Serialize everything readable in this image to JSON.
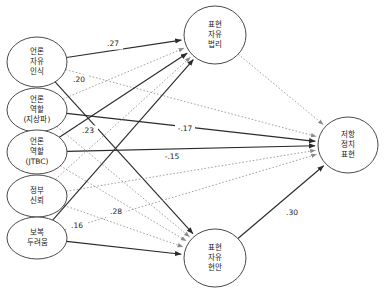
{
  "diagram": {
    "type": "path-diagram",
    "nodes": {
      "exogenous": [
        {
          "id": "press_freedom_perception",
          "label_lines": [
            "언론",
            "자유",
            "인식"
          ],
          "cx": 37,
          "cy": 62,
          "rx": 30,
          "ry": 25
        },
        {
          "id": "press_role_terrestrial",
          "label_lines": [
            "언론",
            "역할",
            "(지상파)"
          ],
          "cx": 37,
          "cy": 110,
          "rx": 30,
          "ry": 22
        },
        {
          "id": "press_role_jtbc",
          "label_lines": [
            "언론",
            "역할",
            "(JTBC)"
          ],
          "cx": 37,
          "cy": 152,
          "rx": 30,
          "ry": 22
        },
        {
          "id": "government_trust",
          "label_lines": [
            "정부",
            "신뢰"
          ],
          "cx": 37,
          "cy": 196,
          "rx": 30,
          "ry": 21
        },
        {
          "id": "fear_of_retaliation",
          "label_lines": [
            "보복",
            "두려움"
          ],
          "cx": 37,
          "cy": 238,
          "rx": 30,
          "ry": 21
        }
      ],
      "mediators": [
        {
          "id": "expression_freedom_jurisprudence",
          "label_lines": [
            "표현",
            "자유",
            "법리"
          ],
          "cx": 215,
          "cy": 35,
          "rx": 31,
          "ry": 29
        },
        {
          "id": "expression_freedom_issues",
          "label_lines": [
            "표현",
            "자유",
            "현안"
          ],
          "cx": 215,
          "cy": 258,
          "rx": 31,
          "ry": 29
        }
      ],
      "outcome": [
        {
          "id": "resistance_political_expression",
          "label_lines": [
            "저항",
            "정치",
            "표현"
          ],
          "cx": 348,
          "cy": 145,
          "rx": 30,
          "ry": 28
        }
      ]
    },
    "edges": [
      {
        "id": "e1",
        "from": "press_freedom_perception",
        "to": "expression_freedom_jurisprudence",
        "style": "solid",
        "coefficient": ".27",
        "label_x": 113,
        "label_y": 44
      },
      {
        "id": "e2",
        "from": "press_freedom_perception",
        "to": "expression_freedom_issues",
        "style": "solid",
        "coefficient": ".20",
        "label_x": 79,
        "label_y": 80
      },
      {
        "id": "e3",
        "from": "press_freedom_perception",
        "to": "resistance_political_expression",
        "style": "dotted",
        "coefficient": "",
        "label_x": 0,
        "label_y": 0
      },
      {
        "id": "e4",
        "from": "press_role_terrestrial",
        "to": "resistance_political_expression",
        "style": "solid",
        "coefficient": "-.17",
        "label_x": 185,
        "label_y": 129
      },
      {
        "id": "e5",
        "from": "press_role_terrestrial",
        "to": "expression_freedom_jurisprudence",
        "style": "dotted",
        "coefficient": "",
        "label_x": 0,
        "label_y": 0
      },
      {
        "id": "e6",
        "from": "press_role_terrestrial",
        "to": "expression_freedom_issues",
        "style": "dotted",
        "coefficient": "",
        "label_x": 0,
        "label_y": 0
      },
      {
        "id": "e7",
        "from": "press_role_jtbc",
        "to": "expression_freedom_jurisprudence",
        "style": "solid",
        "coefficient": ".23",
        "label_x": 88,
        "label_y": 131
      },
      {
        "id": "e8",
        "from": "press_role_jtbc",
        "to": "resistance_political_expression",
        "style": "solid",
        "coefficient": "-.15",
        "label_x": 172,
        "label_y": 157
      },
      {
        "id": "e9",
        "from": "press_role_jtbc",
        "to": "expression_freedom_issues",
        "style": "dotted",
        "coefficient": "",
        "label_x": 0,
        "label_y": 0
      },
      {
        "id": "e10",
        "from": "government_trust",
        "to": "expression_freedom_jurisprudence",
        "style": "dotted",
        "coefficient": "",
        "label_x": 0,
        "label_y": 0
      },
      {
        "id": "e11",
        "from": "government_trust",
        "to": "expression_freedom_issues",
        "style": "dotted",
        "coefficient": "",
        "label_x": 0,
        "label_y": 0
      },
      {
        "id": "e12",
        "from": "government_trust",
        "to": "resistance_political_expression",
        "style": "dotted",
        "coefficient": "",
        "label_x": 0,
        "label_y": 0
      },
      {
        "id": "e13",
        "from": "fear_of_retaliation",
        "to": "expression_freedom_jurisprudence",
        "style": "solid",
        "coefficient": ".16",
        "label_x": 77,
        "label_y": 226
      },
      {
        "id": "e14",
        "from": "fear_of_retaliation",
        "to": "expression_freedom_issues",
        "style": "solid",
        "coefficient": ".28",
        "label_x": 116,
        "label_y": 212
      },
      {
        "id": "e15",
        "from": "fear_of_retaliation",
        "to": "resistance_political_expression",
        "style": "dotted",
        "coefficient": "",
        "label_x": 0,
        "label_y": 0
      },
      {
        "id": "e16",
        "from": "expression_freedom_jurisprudence",
        "to": "resistance_political_expression",
        "style": "dotted",
        "coefficient": "",
        "label_x": 0,
        "label_y": 0
      },
      {
        "id": "e17",
        "from": "expression_freedom_issues",
        "to": "resistance_political_expression",
        "style": "solid",
        "coefficient": ".30",
        "label_x": 292,
        "method": "",
        "label_y": 213
      }
    ],
    "colors": {
      "node_stroke": "#4a4a4a",
      "node_fill": "#ffffff",
      "solid_edge": "#2b2b2b",
      "dotted_edge": "#8a8a8a",
      "text": "#1a1a1a",
      "background": "#ffffff"
    }
  }
}
